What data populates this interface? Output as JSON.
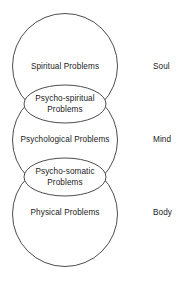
{
  "diagram": {
    "type": "venn-three-circle-vertical",
    "background_color": "#ffffff",
    "stroke_color": "#4d4d4d",
    "text_color": "#1a1a1a",
    "circles": [
      {
        "id": "soul",
        "label": "Spiritual Problems",
        "side_label": "Soul"
      },
      {
        "id": "mind",
        "label": "Psychological Problems",
        "side_label": "Mind"
      },
      {
        "id": "body",
        "label": "Physical Problems",
        "side_label": "Body"
      }
    ],
    "intersections": [
      {
        "id": "psycho-spiritual",
        "line1": "Psycho-spiritual",
        "line2": "Problems"
      },
      {
        "id": "psycho-somatic",
        "line1": "Psycho-somatic",
        "line2": "Problems"
      }
    ]
  }
}
